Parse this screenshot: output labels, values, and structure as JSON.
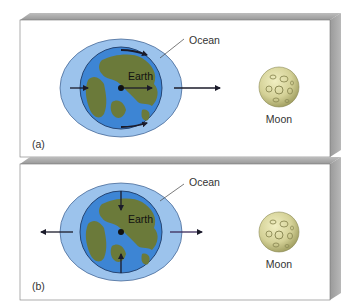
{
  "figure": {
    "panels": [
      {
        "id": "a",
        "label": "(a)",
        "ocean_label": "Ocean",
        "earth_label": "Earth",
        "moon_label": "Moon",
        "description": "Tidal bulges: ocean stretched toward and away from Moon; forces arrows point toward Moon"
      },
      {
        "id": "b",
        "label": "(b)",
        "ocean_label": "Ocean",
        "earth_label": "Earth",
        "moon_label": "Moon",
        "description": "Differential tidal forces relative to Earth's center: outward along Earth-Moon line, inward perpendicular"
      }
    ],
    "colors": {
      "ocean": "#9cc3ec",
      "earth_water": "#3d85d4",
      "land": "#6b7a3a",
      "moon": "#d6d49a",
      "board_face": "#ffffff",
      "board_edge": "#a8a8a8",
      "arrow": "#1b1b2a"
    }
  }
}
